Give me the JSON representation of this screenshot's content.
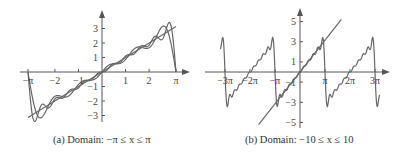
{
  "chart_data": [
    {
      "type": "line",
      "title": "",
      "caption": "(a) Domain: −π ≤ x ≤ π",
      "xlabel": "",
      "ylabel": "",
      "xlim": [
        -3.14159,
        3.14159
      ],
      "ylim": [
        -3.3,
        3.3
      ],
      "grid": false,
      "legend": null,
      "x_ticks": [
        {
          "value": -3.14159,
          "label": "−π"
        },
        {
          "value": -2,
          "label": "−2"
        },
        {
          "value": -1,
          "label": "−1"
        },
        {
          "value": 1,
          "label": "1"
        },
        {
          "value": 2,
          "label": "2"
        },
        {
          "value": 3.14159,
          "label": "π"
        }
      ],
      "y_ticks": [
        {
          "value": 3,
          "label": "3"
        },
        {
          "value": 2,
          "label": "2"
        },
        {
          "value": 1,
          "label": "1"
        },
        {
          "value": -1,
          "label": "−1"
        },
        {
          "value": -2,
          "label": "−2"
        },
        {
          "value": -3,
          "label": "−3"
        }
      ],
      "series": [
        {
          "name": "f(x) = x",
          "kind": "identity"
        },
        {
          "name": "Fourier partial sum (N=5)",
          "kind": "fourier_x",
          "terms": 5
        },
        {
          "name": "Fourier partial sum (N=10)",
          "kind": "fourier_x",
          "terms": 10
        }
      ],
      "sample_points": {
        "x": [
          -3.14,
          -2.7,
          -2,
          -1,
          0,
          1,
          2,
          2.7,
          3.14
        ],
        "identity": [
          -3.14,
          -2.7,
          -2,
          -1,
          0,
          1,
          2,
          2.7,
          3.14
        ],
        "approx_peak": {
          "x": 2.75,
          "y": 3.3
        }
      }
    },
    {
      "type": "line",
      "title": "",
      "caption": "(b) Domain: −10 ≤ x ≤ 10",
      "xlabel": "",
      "ylabel": "",
      "xlim": [
        -10,
        10
      ],
      "ylim": [
        -5.5,
        5.5
      ],
      "grid": false,
      "legend": null,
      "x_ticks": [
        {
          "value": -9.42478,
          "label": "−3π"
        },
        {
          "value": -6.28319,
          "label": "−2π"
        },
        {
          "value": -3.14159,
          "label": "−π"
        },
        {
          "value": 3.14159,
          "label": "π"
        },
        {
          "value": 6.28319,
          "label": "2π"
        },
        {
          "value": 9.42478,
          "label": "3π"
        }
      ],
      "y_ticks": [
        {
          "value": 5,
          "label": "5"
        },
        {
          "value": 3,
          "label": "3"
        },
        {
          "value": 1,
          "label": "1"
        },
        {
          "value": -1,
          "label": "−1"
        },
        {
          "value": -3,
          "label": "−3"
        },
        {
          "value": -5,
          "label": "−5"
        }
      ],
      "series": [
        {
          "name": "f(x) = x",
          "kind": "identity",
          "range": [
            -5.2,
            5.2
          ]
        },
        {
          "name": "Fourier partial sum (N=10)",
          "kind": "fourier_x",
          "terms": 10
        }
      ]
    }
  ],
  "panels": {
    "a": {
      "caption": "(a) Domain: −π ≤ x ≤ π",
      "x_tick_labels": [
        "−π",
        "−2",
        "−1",
        "1",
        "2",
        "π"
      ],
      "y_tick_labels": [
        "3",
        "2",
        "1",
        "−1",
        "−2",
        "−3"
      ]
    },
    "b": {
      "caption": "(b) Domain: −10 ≤ x ≤ 10",
      "x_tick_labels": [
        "−3π",
        "−2π",
        "−π",
        "π",
        "2π",
        "3π"
      ],
      "y_tick_labels": [
        "5",
        "3",
        "1",
        "−1",
        "−3",
        "−5"
      ]
    }
  },
  "colors": {
    "curve": "#666666",
    "axis": "#555555",
    "text": "#333333"
  }
}
